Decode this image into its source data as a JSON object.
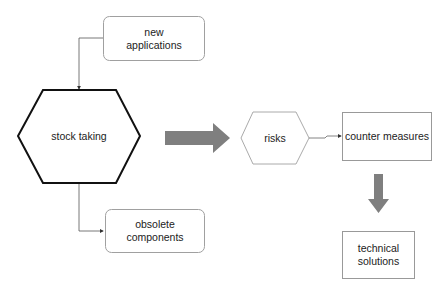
{
  "nodes": {
    "new_applications": "new\napplications",
    "stock_taking": "stock taking",
    "obsolete_components": "obsolete\ncomponents",
    "risks": "risks",
    "counter_measures": "counter measures",
    "technical_solutions": "technical\nsolutions"
  },
  "colors": {
    "arrow_fill": "#7f7f7f",
    "box_border": "#9a9a9a",
    "hex_border": "#111111"
  }
}
